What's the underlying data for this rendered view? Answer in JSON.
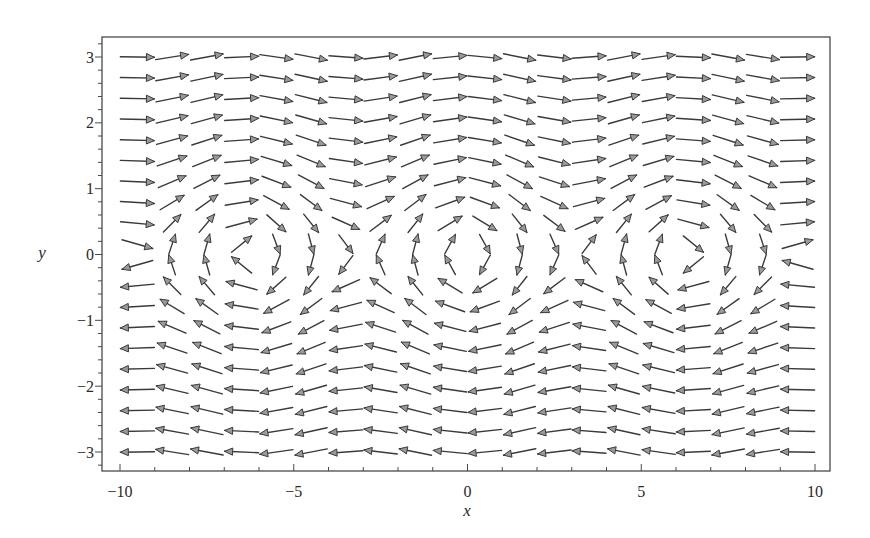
{
  "chart_data": {
    "type": "vector_field",
    "title": "",
    "xlabel": "x",
    "ylabel": "y",
    "xlim": [
      -10,
      10
    ],
    "ylim": [
      -3.3,
      3.3
    ],
    "grid": false,
    "legend": null,
    "field": {
      "dx_dt": "y",
      "dy_dt": "-sin(x)",
      "arrows": "normalized direction"
    },
    "x_ticks": [
      -10,
      -5,
      0,
      5,
      10
    ],
    "x_tick_labels": [
      "−10",
      "−5",
      "0",
      "5",
      "10"
    ],
    "x_minor_step": 1,
    "y_ticks": [
      -3,
      -2,
      -1,
      0,
      1,
      2,
      3
    ],
    "y_tick_labels": [
      "−3",
      "−2",
      "−1",
      "0",
      "1",
      "2",
      "3"
    ],
    "y_minor_step": 0.2,
    "x_grid": [
      -9.5,
      -8.5,
      -7.5,
      -6.5,
      -5.5,
      -4.5,
      -3.5,
      -2.5,
      -1.5,
      -0.5,
      0.5,
      1.5,
      2.5,
      3.5,
      4.5,
      5.5,
      6.5,
      7.5,
      8.5,
      9.5
    ],
    "y_grid": [
      3.0,
      2.6842,
      2.3684,
      2.0526,
      1.7368,
      1.4211,
      1.1053,
      0.7895,
      0.4737,
      0.1579,
      -0.1579,
      -0.4737,
      -0.7895,
      -1.1053,
      -1.4211,
      -1.7368,
      -2.0526,
      -2.3684,
      -2.6842,
      -3.0
    ],
    "u_by_row": [
      3.0,
      2.6842,
      2.3684,
      2.0526,
      1.7368,
      1.4211,
      1.1053,
      0.7895,
      0.4737,
      0.1579,
      -0.1579,
      -0.4737,
      -0.7895,
      -1.1053,
      -1.4211,
      -1.7368,
      -2.0526,
      -2.3684,
      -2.6842,
      -3.0
    ],
    "v_by_col": [
      -0.0752,
      0.7985,
      0.938,
      0.2151,
      -0.7055,
      -0.9775,
      -0.3508,
      0.5985,
      0.9975,
      0.4794,
      -0.4794,
      -0.9975,
      -0.5985,
      0.3508,
      0.9775,
      0.7055,
      -0.2151,
      -0.938,
      -0.7985,
      0.0752
    ]
  },
  "style": {
    "arrow_color": "#3a3a3a",
    "arrowhead_fill": "#9a9a9a",
    "frame_color": "#4a4a4a"
  }
}
